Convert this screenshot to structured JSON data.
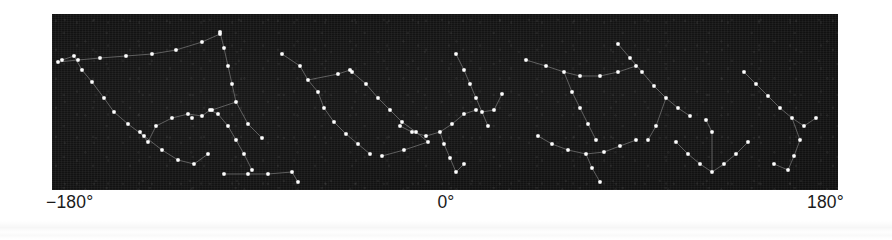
{
  "figure": {
    "name": "galactic-longitude-star-map",
    "background_color": "#ffffff",
    "panel": {
      "background_color": "#121212",
      "star_color": "#ffffff",
      "link_color": "#8d8d8d",
      "x": 52,
      "y": 14,
      "width": 786,
      "height": 176
    }
  },
  "axis": {
    "left_label": "−180°",
    "center_label": "0°",
    "right_label": "180°"
  },
  "chart_data": {
    "type": "scatter",
    "title": "",
    "xlabel": "",
    "ylabel": "",
    "xlim": [
      -180,
      180
    ],
    "ylim": [
      0,
      1
    ],
    "grid": false,
    "legend": "none",
    "tick_labels": [
      "−180°",
      "0°",
      "180°"
    ],
    "tick_values": [
      -180,
      0,
      180
    ],
    "star_count": 148,
    "constellation_count": 14,
    "constellations": [
      {
        "name": "group-1",
        "stars": [
          [
            10,
            46
          ],
          [
            22,
            42
          ],
          [
            30,
            56
          ],
          [
            40,
            68
          ],
          [
            52,
            84
          ],
          [
            62,
            98
          ],
          [
            76,
            110
          ],
          [
            92,
            122
          ],
          [
            110,
            136
          ],
          [
            126,
            146
          ],
          [
            142,
            150
          ],
          [
            156,
            140
          ]
        ],
        "links": [
          [
            0,
            1
          ],
          [
            1,
            2
          ],
          [
            2,
            3
          ],
          [
            3,
            4
          ],
          [
            4,
            5
          ],
          [
            5,
            6
          ],
          [
            6,
            7
          ],
          [
            7,
            8
          ],
          [
            8,
            9
          ],
          [
            9,
            10
          ],
          [
            10,
            11
          ]
        ]
      },
      {
        "name": "group-2",
        "stars": [
          [
            6,
            48
          ],
          [
            26,
            46
          ],
          [
            48,
            44
          ],
          [
            74,
            42
          ],
          [
            100,
            40
          ],
          [
            124,
            36
          ],
          [
            150,
            28
          ],
          [
            168,
            20
          ]
        ],
        "links": [
          [
            0,
            1
          ],
          [
            1,
            2
          ],
          [
            2,
            3
          ],
          [
            3,
            4
          ],
          [
            4,
            5
          ],
          [
            5,
            6
          ],
          [
            6,
            7
          ]
        ]
      },
      {
        "name": "group-3",
        "stars": [
          [
            168,
            18
          ],
          [
            172,
            34
          ],
          [
            176,
            52
          ],
          [
            180,
            70
          ],
          [
            184,
            88
          ],
          [
            160,
            96
          ],
          [
            140,
            104
          ],
          [
            196,
            110
          ],
          [
            210,
            124
          ]
        ],
        "links": [
          [
            0,
            1
          ],
          [
            1,
            2
          ],
          [
            2,
            3
          ],
          [
            3,
            4
          ],
          [
            4,
            5
          ],
          [
            4,
            7
          ],
          [
            7,
            8
          ]
        ]
      },
      {
        "name": "group-4",
        "stars": [
          [
            88,
            118
          ],
          [
            96,
            128
          ],
          [
            104,
            112
          ],
          [
            120,
            104
          ],
          [
            136,
            100
          ],
          [
            150,
            102
          ],
          [
            158,
            96
          ],
          [
            166,
            100
          ],
          [
            176,
            112
          ],
          [
            184,
            126
          ],
          [
            192,
            140
          ],
          [
            200,
            156
          ]
        ],
        "links": [
          [
            0,
            1
          ],
          [
            1,
            2
          ],
          [
            2,
            3
          ],
          [
            3,
            4
          ],
          [
            4,
            5
          ],
          [
            5,
            6
          ],
          [
            6,
            7
          ],
          [
            7,
            8
          ],
          [
            8,
            9
          ],
          [
            9,
            10
          ],
          [
            10,
            11
          ]
        ]
      },
      {
        "name": "group-5",
        "stars": [
          [
            230,
            40
          ],
          [
            248,
            52
          ],
          [
            256,
            66
          ],
          [
            266,
            78
          ],
          [
            272,
            94
          ],
          [
            282,
            108
          ],
          [
            294,
            120
          ],
          [
            306,
            130
          ],
          [
            318,
            140
          ],
          [
            286,
            60
          ],
          [
            298,
            56
          ]
        ],
        "links": [
          [
            0,
            1
          ],
          [
            1,
            2
          ],
          [
            2,
            3
          ],
          [
            3,
            4
          ],
          [
            4,
            5
          ],
          [
            5,
            6
          ],
          [
            6,
            7
          ],
          [
            7,
            8
          ],
          [
            2,
            9
          ],
          [
            9,
            10
          ]
        ]
      },
      {
        "name": "group-6",
        "stars": [
          [
            300,
            58
          ],
          [
            314,
            70
          ],
          [
            326,
            84
          ],
          [
            338,
            96
          ],
          [
            350,
            108
          ],
          [
            364,
            118
          ],
          [
            376,
            128
          ],
          [
            352,
            136
          ],
          [
            330,
            142
          ]
        ],
        "links": [
          [
            0,
            1
          ],
          [
            1,
            2
          ],
          [
            2,
            3
          ],
          [
            3,
            4
          ],
          [
            4,
            5
          ],
          [
            5,
            6
          ],
          [
            6,
            7
          ],
          [
            7,
            8
          ]
        ]
      },
      {
        "name": "group-7",
        "stars": [
          [
            172,
            160
          ],
          [
            196,
            160
          ],
          [
            216,
            160
          ],
          [
            240,
            158
          ],
          [
            246,
            168
          ]
        ],
        "links": [
          [
            0,
            1
          ],
          [
            1,
            2
          ],
          [
            2,
            3
          ],
          [
            3,
            4
          ]
        ]
      },
      {
        "name": "group-8",
        "stars": [
          [
            348,
            112
          ],
          [
            360,
            118
          ],
          [
            374,
            122
          ],
          [
            388,
            118
          ],
          [
            400,
            110
          ],
          [
            412,
            100
          ],
          [
            424,
            96
          ],
          [
            392,
            130
          ],
          [
            398,
            144
          ],
          [
            404,
            158
          ],
          [
            412,
            150
          ]
        ],
        "links": [
          [
            0,
            1
          ],
          [
            1,
            2
          ],
          [
            2,
            3
          ],
          [
            3,
            4
          ],
          [
            4,
            5
          ],
          [
            5,
            6
          ],
          [
            3,
            7
          ],
          [
            7,
            8
          ],
          [
            8,
            9
          ],
          [
            9,
            10
          ]
        ]
      },
      {
        "name": "group-9",
        "stars": [
          [
            404,
            40
          ],
          [
            412,
            56
          ],
          [
            418,
            70
          ],
          [
            424,
            84
          ],
          [
            430,
            98
          ],
          [
            436,
            112
          ],
          [
            442,
            96
          ],
          [
            450,
            80
          ]
        ],
        "links": [
          [
            0,
            1
          ],
          [
            1,
            2
          ],
          [
            2,
            3
          ],
          [
            3,
            4
          ],
          [
            4,
            5
          ],
          [
            4,
            6
          ],
          [
            6,
            7
          ]
        ]
      },
      {
        "name": "group-10",
        "stars": [
          [
            474,
            46
          ],
          [
            494,
            52
          ],
          [
            512,
            58
          ],
          [
            528,
            62
          ],
          [
            548,
            62
          ],
          [
            566,
            58
          ],
          [
            584,
            52
          ],
          [
            520,
            78
          ],
          [
            528,
            94
          ],
          [
            536,
            110
          ],
          [
            544,
            126
          ]
        ],
        "links": [
          [
            0,
            1
          ],
          [
            1,
            2
          ],
          [
            2,
            3
          ],
          [
            3,
            4
          ],
          [
            4,
            5
          ],
          [
            5,
            6
          ],
          [
            2,
            7
          ],
          [
            7,
            8
          ],
          [
            8,
            9
          ],
          [
            9,
            10
          ]
        ]
      },
      {
        "name": "group-11",
        "stars": [
          [
            566,
            30
          ],
          [
            578,
            44
          ],
          [
            590,
            58
          ],
          [
            602,
            72
          ],
          [
            614,
            84
          ],
          [
            626,
            94
          ],
          [
            638,
            102
          ],
          [
            604,
            112
          ],
          [
            596,
            126
          ]
        ],
        "links": [
          [
            0,
            1
          ],
          [
            1,
            2
          ],
          [
            2,
            3
          ],
          [
            3,
            4
          ],
          [
            4,
            5
          ],
          [
            5,
            6
          ],
          [
            4,
            7
          ],
          [
            7,
            8
          ]
        ]
      },
      {
        "name": "group-12",
        "stars": [
          [
            486,
            122
          ],
          [
            500,
            130
          ],
          [
            516,
            136
          ],
          [
            534,
            140
          ],
          [
            552,
            138
          ],
          [
            568,
            132
          ],
          [
            584,
            126
          ],
          [
            540,
            154
          ],
          [
            548,
            168
          ]
        ],
        "links": [
          [
            0,
            1
          ],
          [
            1,
            2
          ],
          [
            2,
            3
          ],
          [
            3,
            4
          ],
          [
            4,
            5
          ],
          [
            5,
            6
          ],
          [
            3,
            7
          ],
          [
            7,
            8
          ]
        ]
      },
      {
        "name": "group-13",
        "stars": [
          [
            624,
            128
          ],
          [
            636,
            140
          ],
          [
            648,
            150
          ],
          [
            660,
            158
          ],
          [
            672,
            150
          ],
          [
            684,
            140
          ],
          [
            696,
            128
          ],
          [
            660,
            118
          ],
          [
            654,
            106
          ]
        ],
        "links": [
          [
            0,
            1
          ],
          [
            1,
            2
          ],
          [
            2,
            3
          ],
          [
            3,
            4
          ],
          [
            4,
            5
          ],
          [
            5,
            6
          ],
          [
            3,
            7
          ],
          [
            7,
            8
          ]
        ]
      },
      {
        "name": "group-14",
        "stars": [
          [
            692,
            58
          ],
          [
            704,
            70
          ],
          [
            716,
            82
          ],
          [
            728,
            94
          ],
          [
            740,
            104
          ],
          [
            752,
            112
          ],
          [
            764,
            104
          ],
          [
            748,
            126
          ],
          [
            742,
            142
          ],
          [
            736,
            156
          ],
          [
            722,
            150
          ]
        ],
        "links": [
          [
            0,
            1
          ],
          [
            1,
            2
          ],
          [
            2,
            3
          ],
          [
            3,
            4
          ],
          [
            4,
            5
          ],
          [
            5,
            6
          ],
          [
            4,
            7
          ],
          [
            7,
            8
          ],
          [
            8,
            9
          ],
          [
            9,
            10
          ]
        ]
      }
    ]
  }
}
